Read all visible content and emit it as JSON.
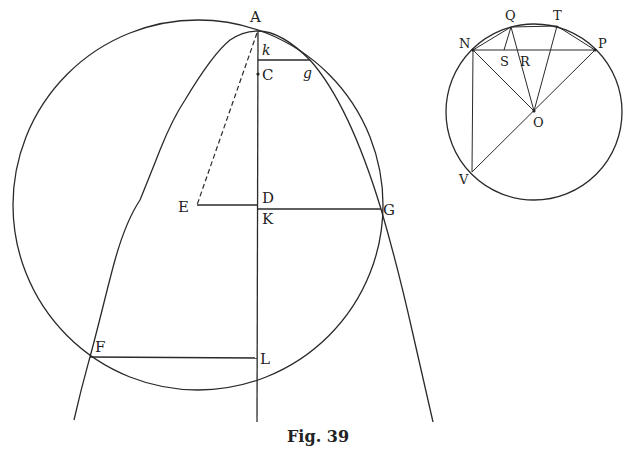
{
  "figure": {
    "caption": "Fig. 39",
    "left_diagram": {
      "description": "Parabola with vertex A on vertical axis, large circle through A intersecting parabola at g, G, F",
      "labels": {
        "A": "A",
        "k": "k",
        "g": "g",
        "C": "C",
        "E": "E",
        "D": "D",
        "K": "K",
        "G": "G",
        "F": "F",
        "L": "L"
      },
      "points": {
        "A": [
          258,
          31
        ],
        "C": [
          258,
          74
        ],
        "k": [
          258,
          60
        ],
        "g": [
          310,
          60
        ],
        "E": [
          197,
          205
        ],
        "D": [
          258,
          205
        ],
        "K": [
          258,
          209
        ],
        "G": [
          381,
          209
        ],
        "F": [
          90,
          357
        ],
        "L": [
          257,
          357
        ]
      },
      "circle": {
        "cx": 198,
        "cy": 205,
        "r": 185
      },
      "segments": [
        "k-g",
        "E-D",
        "K-G",
        "F-L",
        "A-E (dashed)",
        "axis A-bottom"
      ]
    },
    "right_diagram": {
      "description": "Circle with center O, chord NP, points Q and T on arc, diameter P-V through O",
      "labels": {
        "N": "N",
        "Q": "Q",
        "T": "T",
        "P": "P",
        "S": "S",
        "R": "R",
        "O": "O",
        "V": "V"
      },
      "points": {
        "N": [
          473,
          50
        ],
        "Q": [
          511,
          27
        ],
        "T": [
          557,
          27
        ],
        "P": [
          595,
          50
        ],
        "S": [
          503,
          50
        ],
        "R": [
          523,
          50
        ],
        "O": [
          534,
          111
        ],
        "V": [
          472,
          172
        ]
      },
      "circle": {
        "cx": 534,
        "cy": 112,
        "r": 88
      },
      "segments": [
        "N-P",
        "N-Q",
        "Q-T",
        "T-P",
        "Q-S",
        "Q-O",
        "T-O",
        "N-O",
        "N-V",
        "P-V"
      ]
    }
  }
}
